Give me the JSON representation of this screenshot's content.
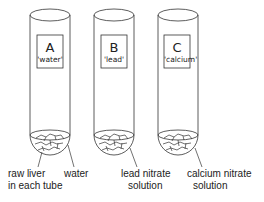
{
  "tubes": [
    {
      "letter": "A",
      "label": "'water'"
    },
    {
      "letter": "B",
      "label": "'lead'"
    },
    {
      "letter": "C",
      "label": "'calcium'"
    }
  ],
  "annotations": {
    "liver_line1": "raw liver",
    "liver_line2": "in each tube",
    "water": "water",
    "lead_line1": "lead nitrate",
    "lead_line2": "solution",
    "calcium_line1": "calcium nitrate",
    "calcium_line2": "solution"
  }
}
